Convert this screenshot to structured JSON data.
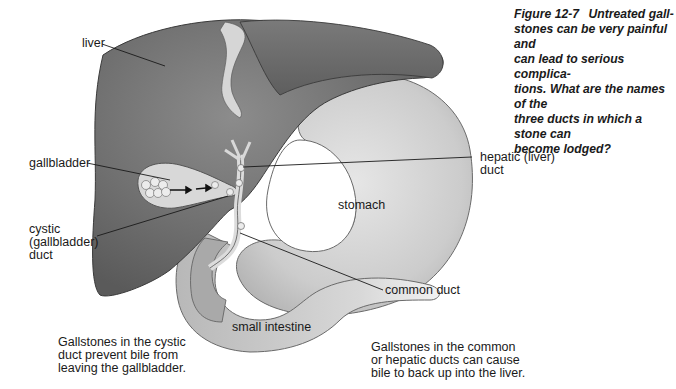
{
  "figure": {
    "number": "Figure 12-7",
    "caption_lines": [
      "Untreated gall-",
      "stones can be very painful and",
      "can lead to serious complica-",
      "tions. What are the names of the",
      "three ducts in which a stone can",
      "become lodged?"
    ]
  },
  "labels": {
    "liver": "liver",
    "gallbladder": "gallbladder",
    "cystic_duct": [
      "cystic",
      "(gallbladder)",
      "duct"
    ],
    "hepatic_duct": [
      "hepatic (liver)",
      "duct"
    ],
    "stomach": "stomach",
    "common_duct": "common duct",
    "small_intestine": "small intestine"
  },
  "notes": {
    "left": [
      "Gallstones in the cystic",
      "duct prevent bile from",
      "leaving the gallbladder."
    ],
    "right": [
      "Gallstones in the common",
      "or hepatic ducts can cause",
      "bile to back up into the liver."
    ]
  },
  "colors": {
    "liver": "#6e6e6e",
    "stomach": "#cfcfcf",
    "intestine": "#c4c4c4",
    "gallbladder": "#d8d8d8",
    "stone": "#ececec",
    "ink": "#1a1a1a"
  }
}
